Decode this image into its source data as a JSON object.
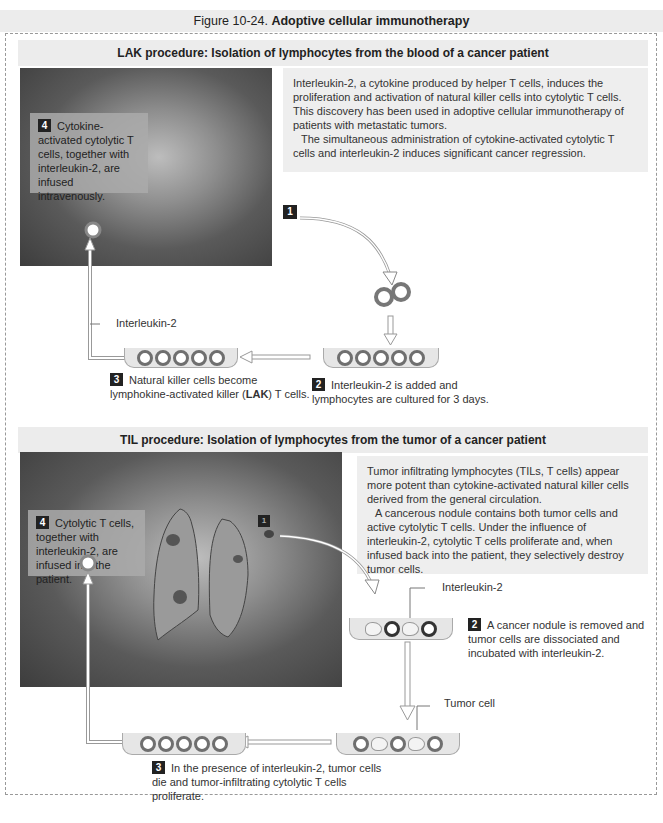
{
  "figure": {
    "number": "Figure 10-24.",
    "title": "Adoptive cellular immunotherapy"
  },
  "lak": {
    "heading": "LAK procedure: Isolation of lymphocytes from the blood of a cancer patient",
    "info_p1": "Interleukin-2, a cytokine produced by helper T cells, induces the proliferation and activation of natural killer cells into cytolytic T cells. This discovery has been used in adoptive cellular immunotherapy of patients with metastatic tumors.",
    "info_p2": "The simultaneous administration of cytokine-activated cytolytic T cells and interleukin-2 induces significant cancer regression.",
    "step1_num": "1",
    "step2_num": "2",
    "step2_text": "Interleukin-2 is added and lymphocytes are cultured for 3 days.",
    "step3_num": "3",
    "step3_text_a": "Natural killer cells become lymphokine-activated killer (",
    "step3_text_bold": "LAK",
    "step3_text_b": ") T cells.",
    "step4_num": "4",
    "step4_text": "Cytokine-activated cytolytic T cells, together with interleukin-2, are infused intravenously.",
    "il2_label": "Interleukin-2"
  },
  "til": {
    "heading": "TIL procedure: Isolation of lymphocytes from the tumor of a cancer patient",
    "info_p1": "Tumor infiltrating lymphocytes (TILs, T cells) appear more potent than cytokine-activated natural killer cells derived from the general circulation.",
    "info_p2": "A cancerous nodule contains both tumor cells and active cytolytic T cells. Under the influence of interleukin-2, cytolytic T cells proliferate and, when infused back into the patient, they selectively destroy tumor cells.",
    "step1_num": "1",
    "step2_num": "2",
    "step2_text": "A cancer nodule is removed and tumor cells are dissociated and incubated with interleukin-2.",
    "step3_num": "3",
    "step3_text": "In the presence of interleukin-2, tumor cells die and tumor-infiltrating cytolytic T cells proliferate.",
    "step4_num": "4",
    "step4_text": "Cytolytic T cells, together with interleukin-2, are infused into the patient.",
    "il2_label": "Interleukin-2",
    "tumor_label": "Tumor cell"
  }
}
